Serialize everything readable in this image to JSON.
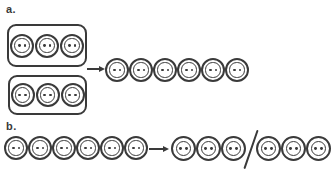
{
  "colors": {
    "ink": "#3a3a3a",
    "background": "#ffffff"
  },
  "icons": {
    "item": "two-hole-button-icon",
    "arrow": "→",
    "separator": "/"
  },
  "part_a": {
    "label": "a.",
    "groups": [
      {
        "count": 3
      },
      {
        "count": 3
      }
    ],
    "arrow": "→",
    "result_count": 6
  },
  "part_b": {
    "label": "b.",
    "source_count": 6,
    "arrow": "→",
    "result_groups": [
      {
        "count": 3
      },
      {
        "count": 3
      }
    ],
    "separator": "/"
  }
}
